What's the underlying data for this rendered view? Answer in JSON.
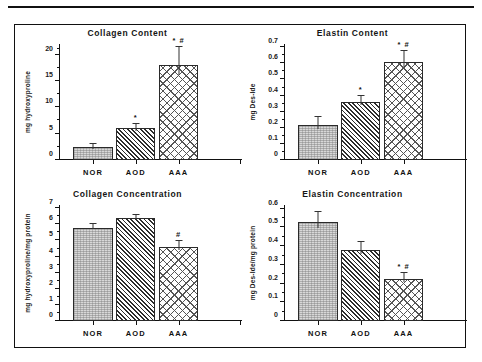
{
  "figure": {
    "panels": [
      {
        "id": "collagen-content",
        "title": "Collagen  Content",
        "ylabel": "mg  hydroxyproline",
        "ymin": 0,
        "ymax": 22,
        "yticks": [
          0,
          5,
          10,
          15,
          20
        ],
        "yminor": [
          2.5,
          7.5,
          12.5,
          17.5,
          21
        ],
        "categories": [
          "NOR",
          "AOD",
          "AAA"
        ],
        "values": [
          2.5,
          6.0,
          18.0
        ],
        "errors": [
          0.6,
          0.8,
          3.4
        ],
        "sig": [
          "",
          "*",
          "* #"
        ]
      },
      {
        "id": "elastin-content",
        "title": "Elastin  Content",
        "ylabel": "mg  Des-Ide",
        "ymin": 0,
        "ymax": 0.72,
        "yticks": [
          0,
          0.1,
          0.2,
          0.3,
          0.4,
          0.5,
          0.6,
          0.7
        ],
        "yminor": [
          0.05,
          0.15,
          0.25,
          0.35,
          0.45,
          0.55,
          0.65
        ],
        "categories": [
          "NOR",
          "AOD",
          "AAA"
        ],
        "values": [
          0.22,
          0.36,
          0.61
        ],
        "errors": [
          0.05,
          0.035,
          0.065
        ],
        "sig": [
          "",
          "*",
          "* #"
        ]
      },
      {
        "id": "collagen-concentration",
        "title": "Collagen  Concentration",
        "ylabel": "mg  hydroxyproline/mg  protein",
        "ymin": 0,
        "ymax": 7.2,
        "yticks": [
          0,
          1,
          2,
          3,
          4,
          5,
          6,
          7
        ],
        "yminor": [
          0.5,
          1.5,
          2.5,
          3.5,
          4.5,
          5.5,
          6.5
        ],
        "categories": [
          "NOR",
          "AOD",
          "AAA"
        ],
        "values": [
          5.8,
          6.4,
          4.6
        ],
        "errors": [
          0.2,
          0.2,
          0.35
        ],
        "sig": [
          "",
          "",
          "#"
        ]
      },
      {
        "id": "elastin-concentration",
        "title": "Elastin  Concentration",
        "ylabel": "mg  Des-Ide/mg  protein",
        "ymin": 0,
        "ymax": 0.62,
        "yticks": [
          0,
          0.1,
          0.2,
          0.3,
          0.4,
          0.5,
          0.6
        ],
        "yminor": [
          0.05,
          0.15,
          0.25,
          0.35,
          0.45,
          0.55
        ],
        "categories": [
          "NOR",
          "AOD",
          "AAA"
        ],
        "values": [
          0.53,
          0.38,
          0.225
        ],
        "errors": [
          0.055,
          0.04,
          0.03
        ],
        "sig": [
          "",
          "",
          "* #"
        ]
      }
    ]
  },
  "chart_data": [
    {
      "type": "bar",
      "title": "Collagen  Content",
      "xlabel": "",
      "ylabel": "mg  hydroxyproline",
      "categories": [
        "NOR",
        "AOD",
        "AAA"
      ],
      "values": [
        2.5,
        6.0,
        18.0
      ],
      "errors": [
        0.6,
        0.8,
        3.4
      ],
      "annotations": [
        "",
        "*",
        "* #"
      ],
      "ylim": [
        0,
        22
      ],
      "yticks": [
        0,
        5,
        10,
        15,
        20
      ],
      "grid": false,
      "legend": "none"
    },
    {
      "type": "bar",
      "title": "Elastin  Content",
      "xlabel": "",
      "ylabel": "mg  Des-Ide",
      "categories": [
        "NOR",
        "AOD",
        "AAA"
      ],
      "values": [
        0.22,
        0.36,
        0.61
      ],
      "errors": [
        0.05,
        0.035,
        0.065
      ],
      "annotations": [
        "",
        "*",
        "* #"
      ],
      "ylim": [
        0,
        0.7
      ],
      "yticks": [
        0,
        0.1,
        0.2,
        0.3,
        0.4,
        0.5,
        0.6,
        0.7
      ],
      "grid": false,
      "legend": "none"
    },
    {
      "type": "bar",
      "title": "Collagen  Concentration",
      "xlabel": "",
      "ylabel": "mg  hydroxyproline/mg  protein",
      "categories": [
        "NOR",
        "AOD",
        "AAA"
      ],
      "values": [
        5.8,
        6.4,
        4.6
      ],
      "errors": [
        0.2,
        0.2,
        0.35
      ],
      "annotations": [
        "",
        "",
        "#"
      ],
      "ylim": [
        0,
        7
      ],
      "yticks": [
        0,
        1,
        2,
        3,
        4,
        5,
        6,
        7
      ],
      "grid": false,
      "legend": "none"
    },
    {
      "type": "bar",
      "title": "Elastin  Concentration",
      "xlabel": "",
      "ylabel": "mg  Des-Ide/mg  protein",
      "categories": [
        "NOR",
        "AOD",
        "AAA"
      ],
      "values": [
        0.53,
        0.38,
        0.225
      ],
      "errors": [
        0.055,
        0.04,
        0.03
      ],
      "annotations": [
        "",
        "",
        "* #"
      ],
      "ylim": [
        0,
        0.6
      ],
      "yticks": [
        0,
        0.1,
        0.2,
        0.3,
        0.4,
        0.5,
        0.6
      ],
      "grid": false,
      "legend": "none"
    }
  ]
}
